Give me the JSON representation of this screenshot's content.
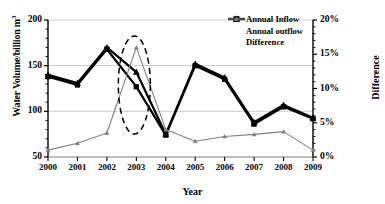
{
  "chart_data": {
    "type": "line",
    "title": "",
    "xlabel": "Year",
    "ylabel": "Water Volume/billion m",
    "ylabel_sup": "3",
    "ylabel_right": "Difference",
    "categories": [
      "2000",
      "2001",
      "2002",
      "2003",
      "2004",
      "2005",
      "2006",
      "2007",
      "2008",
      "2009"
    ],
    "ylim": [
      50,
      200
    ],
    "yticks": [
      "50",
      "100",
      "150",
      "200"
    ],
    "ytick_values": [
      50,
      100,
      150,
      200
    ],
    "ylim_right": [
      0,
      20
    ],
    "yticks_right": [
      "0%",
      "5%",
      "10%",
      "15%",
      "20%"
    ],
    "ytick_values_right": [
      0,
      5,
      10,
      15,
      20
    ],
    "grid": true,
    "legend_position": "top-right",
    "series": [
      {
        "name": "Annual Inflow",
        "axis": "left",
        "marker": "triangle",
        "color": "#000000",
        "values": [
          140,
          131,
          170,
          143,
          75,
          152,
          137,
          88,
          107,
          93
        ]
      },
      {
        "name": "Annual outflow",
        "axis": "left",
        "marker": "square",
        "color": "#000000",
        "values": [
          138,
          129,
          168,
          127,
          74,
          150,
          135,
          86,
          105,
          92
        ]
      },
      {
        "name": "Difference",
        "axis": "right",
        "marker": "triangle",
        "color": "#808080",
        "values": [
          1.0,
          2.0,
          3.5,
          16.0,
          4.0,
          2.3,
          3.0,
          3.3,
          3.7,
          1.0
        ]
      }
    ],
    "annotations": [
      {
        "type": "ellipse-dashed",
        "label": "",
        "center_year": "2003",
        "color": "#000000"
      }
    ]
  }
}
